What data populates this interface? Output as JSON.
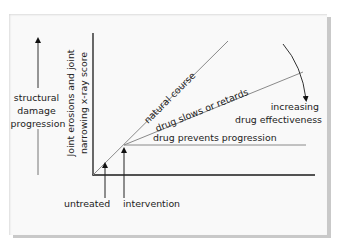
{
  "diagram": {
    "left_annotation": {
      "lines": [
        "structural",
        "damage",
        "progression"
      ]
    },
    "y_axis_label": {
      "lines": [
        "Joint erosions and joint",
        "narrowing x-ray score"
      ]
    },
    "series": [
      {
        "id": "natural-course",
        "label": "natural course"
      },
      {
        "id": "drug-slows",
        "label": "drug slows or retards"
      },
      {
        "id": "drug-prevents",
        "label": "drug prevents progression"
      }
    ],
    "effect_annotation": {
      "lines": [
        "increasing",
        "drug effectiveness"
      ]
    },
    "x_markers": [
      {
        "id": "untreated",
        "label": "untreated"
      },
      {
        "id": "intervention",
        "label": "intervention"
      }
    ],
    "colors": {
      "axis": "#1a1a1a",
      "series_line": "#8a8a8a",
      "text": "#222222",
      "panel": "#f9f9f9",
      "shadow": "#c9c9c9"
    }
  }
}
